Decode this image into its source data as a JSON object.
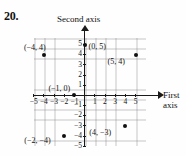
{
  "problem": {
    "number": "20."
  },
  "axes": {
    "vertical_title": "Second axis",
    "horizontal_title_line1": "First",
    "horizontal_title_line2": "axis"
  },
  "ticks": {
    "x_negative": [
      "-5",
      "-4",
      "-3",
      "-2",
      "-1"
    ],
    "x_positive": [
      "1",
      "2",
      "3",
      "4",
      "5"
    ],
    "y_positive": [
      "5",
      "4",
      "3",
      "2",
      "1"
    ],
    "y_negative": [
      "-1",
      "-2",
      "-3",
      "-4",
      "-5"
    ]
  },
  "chart_data": {
    "type": "scatter",
    "title": "",
    "xlabel": "First axis",
    "ylabel": "Second axis",
    "xlim": [
      -5.5,
      5.5
    ],
    "ylim": [
      -5.5,
      5.5
    ],
    "grid": true,
    "legend": "none",
    "xticks": [
      -5,
      -4,
      -3,
      -2,
      -1,
      1,
      2,
      3,
      4,
      5
    ],
    "yticks": [
      5,
      4,
      3,
      2,
      1,
      -1,
      -2,
      -3,
      -4,
      -5
    ],
    "points": [
      {
        "label": "(-4, 4)",
        "x": -4,
        "y": 4,
        "label_dx": -20,
        "label_dy": -12
      },
      {
        "label": "(0, 5)",
        "x": 0,
        "y": 5,
        "label_dx": 4,
        "label_dy": -3
      },
      {
        "label": "(5, 4)",
        "x": 5,
        "y": 4,
        "label_dx": -28,
        "label_dy": 2
      },
      {
        "label": "(-1, 0)",
        "x": -1,
        "y": 0,
        "label_dx": -26,
        "label_dy": -11
      },
      {
        "label": "(-2, -4)",
        "x": -2,
        "y": -4,
        "label_dx": -40,
        "label_dy": 0
      },
      {
        "label": "(4, -3)",
        "x": 4,
        "y": -3,
        "label_dx": -36,
        "label_dy": 2
      }
    ]
  },
  "colors": {
    "ink": "#111111",
    "grid": "#9a9a9a",
    "background": "#fefefe"
  }
}
